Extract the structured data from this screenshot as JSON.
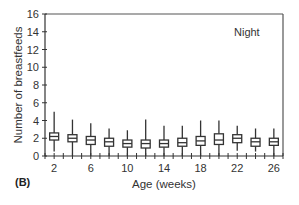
{
  "panel_label": "(B)",
  "annotation": "Night",
  "chart_data": {
    "type": "box",
    "title": "",
    "annotation": "Night",
    "panel_label": "(B)",
    "xlabel": "Age (weeks)",
    "ylabel": "Number of breastfeeds",
    "ylim": [
      0,
      16
    ],
    "yticks": [
      0,
      2,
      4,
      6,
      8,
      10,
      12,
      14,
      16
    ],
    "xticks_labeled": [
      2,
      6,
      10,
      14,
      18,
      22,
      26
    ],
    "xlim": [
      1,
      27
    ],
    "grid": false,
    "categories": [
      2,
      4,
      6,
      8,
      10,
      12,
      14,
      16,
      18,
      20,
      22,
      24,
      26
    ],
    "boxes": [
      {
        "week": 2,
        "min": 0.5,
        "q1": 1.8,
        "median": 2.2,
        "q3": 2.6,
        "max": 5.0
      },
      {
        "week": 4,
        "min": 0.0,
        "q1": 1.6,
        "median": 2.0,
        "q3": 2.4,
        "max": 4.1
      },
      {
        "week": 6,
        "min": 0.0,
        "q1": 1.3,
        "median": 1.8,
        "q3": 2.2,
        "max": 3.7
      },
      {
        "week": 8,
        "min": 0.0,
        "q1": 1.1,
        "median": 1.6,
        "q3": 2.0,
        "max": 3.1
      },
      {
        "week": 10,
        "min": 0.0,
        "q1": 1.0,
        "median": 1.4,
        "q3": 1.8,
        "max": 2.9
      },
      {
        "week": 12,
        "min": 0.0,
        "q1": 0.9,
        "median": 1.4,
        "q3": 1.8,
        "max": 4.1
      },
      {
        "week": 14,
        "min": 0.0,
        "q1": 1.0,
        "median": 1.4,
        "q3": 1.8,
        "max": 3.4
      },
      {
        "week": 16,
        "min": 0.0,
        "q1": 1.1,
        "median": 1.5,
        "q3": 2.0,
        "max": 3.4
      },
      {
        "week": 18,
        "min": 0.0,
        "q1": 1.2,
        "median": 1.7,
        "q3": 2.2,
        "max": 4.0
      },
      {
        "week": 20,
        "min": 0.0,
        "q1": 1.3,
        "median": 1.8,
        "q3": 2.5,
        "max": 4.0
      },
      {
        "week": 22,
        "min": 0.6,
        "q1": 1.5,
        "median": 2.0,
        "q3": 2.4,
        "max": 3.4
      },
      {
        "week": 24,
        "min": 0.5,
        "q1": 1.1,
        "median": 1.6,
        "q3": 2.0,
        "max": 3.1
      },
      {
        "week": 26,
        "min": 0.0,
        "q1": 1.2,
        "median": 1.6,
        "q3": 2.0,
        "max": 3.1
      }
    ]
  }
}
